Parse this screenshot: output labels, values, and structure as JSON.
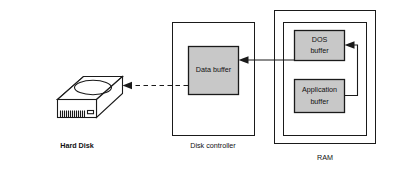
{
  "diagram": {
    "colors": {
      "buffer_fill": "#c8c8c8",
      "line": "#1a1a1a",
      "background": "#ffffff",
      "device_fill": "#ffffff"
    },
    "nodes": {
      "hard_disk": {
        "label": "Hard Disk",
        "type": "device-illustration",
        "icon": "hard-disk-drive-icon"
      },
      "disk_controller": {
        "label": "Disk controller",
        "type": "container"
      },
      "data_buffer": {
        "label": "Data buffer",
        "type": "buffer"
      },
      "ram": {
        "label": "RAM",
        "type": "container-nested"
      },
      "dos_buffer": {
        "label_line1": "DOS",
        "label_line2": "buffer",
        "type": "buffer"
      },
      "application_buffer": {
        "label_line1": "Application",
        "label_line2": "buffer",
        "type": "buffer"
      }
    },
    "edges": [
      {
        "name": "data-buffer-to-hard-disk",
        "from": "data_buffer",
        "to": "hard_disk",
        "style": "dashed",
        "direction": "left",
        "arrowhead": true
      },
      {
        "name": "dos-buffer-to-data-buffer",
        "from": "dos_buffer",
        "to": "data_buffer",
        "style": "solid",
        "direction": "left",
        "arrowhead": true
      },
      {
        "name": "application-buffer-to-dos-buffer",
        "from": "application_buffer",
        "to": "dos_buffer",
        "style": "solid",
        "direction": "left",
        "arrowhead": true,
        "routing": "orthogonal-right-up-left"
      }
    ]
  }
}
